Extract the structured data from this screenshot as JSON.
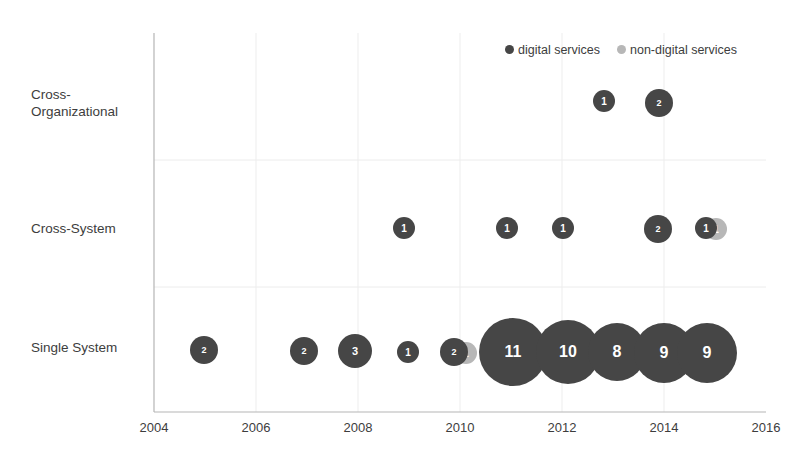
{
  "chart_data": {
    "type": "scatter",
    "title": "",
    "xlabel": "",
    "ylabel": "",
    "grid": true,
    "legend_position": "top-right",
    "xlim": [
      2004,
      2016
    ],
    "x_ticks": [
      "2004",
      "2006",
      "2008",
      "2010",
      "2012",
      "2014",
      "2016"
    ],
    "y_categories": [
      "Cross-\nOrganizational",
      "Cross-System",
      "Single System"
    ],
    "legend": [
      {
        "name": "digital services",
        "color": "#464646"
      },
      {
        "name": "non-digital services",
        "color": "#b7b7b7"
      }
    ],
    "series": [
      {
        "name": "digital services",
        "color": "#464646",
        "points": [
          {
            "x": 2013,
            "category": "Cross-Organizational",
            "value": 1
          },
          {
            "x": 2014,
            "category": "Cross-Organizational",
            "value": 2
          },
          {
            "x": 2009,
            "category": "Cross-System",
            "value": 1
          },
          {
            "x": 2011,
            "category": "Cross-System",
            "value": 1
          },
          {
            "x": 2012,
            "category": "Cross-System",
            "value": 1
          },
          {
            "x": 2014,
            "category": "Cross-System",
            "value": 2
          },
          {
            "x": 2015,
            "category": "Cross-System",
            "value": 1
          },
          {
            "x": 2005,
            "category": "Single System",
            "value": 2
          },
          {
            "x": 2007,
            "category": "Single System",
            "value": 2
          },
          {
            "x": 2008,
            "category": "Single System",
            "value": 3
          },
          {
            "x": 2009,
            "category": "Single System",
            "value": 1
          },
          {
            "x": 2010,
            "category": "Single System",
            "value": 2
          },
          {
            "x": 2011,
            "category": "Single System",
            "value": 11
          },
          {
            "x": 2012,
            "category": "Single System",
            "value": 10
          },
          {
            "x": 2013,
            "category": "Single System",
            "value": 8
          },
          {
            "x": 2014,
            "category": "Single System",
            "value": 9
          },
          {
            "x": 2015,
            "category": "Single System",
            "value": 9
          }
        ]
      },
      {
        "name": "non-digital services",
        "color": "#b7b7b7",
        "points": [
          {
            "x": 2015,
            "category": "Cross-System",
            "value": 1
          },
          {
            "x": 2010,
            "category": "Single System",
            "value": 1
          }
        ]
      }
    ],
    "bubbles": [
      {
        "label": "1",
        "series": "digital services",
        "cx": 604,
        "cy": 101,
        "r": 11
      },
      {
        "label": "2",
        "series": "digital services",
        "cx": 659,
        "cy": 103,
        "r": 14
      },
      {
        "label": "1",
        "series": "digital services",
        "cx": 404,
        "cy": 228,
        "r": 11
      },
      {
        "label": "1",
        "series": "digital services",
        "cx": 507,
        "cy": 228,
        "r": 11
      },
      {
        "label": "1",
        "series": "digital services",
        "cx": 563,
        "cy": 228,
        "r": 11
      },
      {
        "label": "2",
        "series": "digital services",
        "cx": 658,
        "cy": 229,
        "r": 14
      },
      {
        "label": "1",
        "series": "digital services",
        "cx": 706,
        "cy": 228,
        "r": 11
      },
      {
        "label": "1",
        "series": "non-digital services",
        "cx": 716,
        "cy": 229,
        "r": 11
      },
      {
        "label": "2",
        "series": "digital services",
        "cx": 204,
        "cy": 350,
        "r": 14
      },
      {
        "label": "2",
        "series": "digital services",
        "cx": 304,
        "cy": 351,
        "r": 14
      },
      {
        "label": "3",
        "series": "digital services",
        "cx": 355,
        "cy": 351,
        "r": 17
      },
      {
        "label": "1",
        "series": "digital services",
        "cx": 408,
        "cy": 352,
        "r": 11
      },
      {
        "label": "2",
        "series": "digital services",
        "cx": 454,
        "cy": 352,
        "r": 14
      },
      {
        "label": "1",
        "series": "non-digital services",
        "cx": 466,
        "cy": 353,
        "r": 11
      },
      {
        "label": "11",
        "series": "digital services",
        "cx": 513,
        "cy": 352,
        "r": 34
      },
      {
        "label": "10",
        "series": "digital services",
        "cx": 568,
        "cy": 352,
        "r": 32
      },
      {
        "label": "8",
        "series": "digital services",
        "cx": 617,
        "cy": 352,
        "r": 29
      },
      {
        "label": "9",
        "series": "digital services",
        "cx": 664,
        "cy": 353,
        "r": 30
      },
      {
        "label": "9",
        "series": "digital services",
        "cx": 707,
        "cy": 353,
        "r": 30
      }
    ]
  },
  "axes": {
    "x_ticks": [
      {
        "label": "2004",
        "x": 154
      },
      {
        "label": "2006",
        "x": 256
      },
      {
        "label": "2008",
        "x": 358
      },
      {
        "label": "2010",
        "x": 460
      },
      {
        "label": "2012",
        "x": 562
      },
      {
        "label": "2014",
        "x": 664
      },
      {
        "label": "2016",
        "x": 766
      }
    ],
    "y_labels": [
      {
        "label": "Cross-\nOrganizational"
      },
      {
        "label": "Cross-System"
      },
      {
        "label": "Single System"
      }
    ]
  },
  "legend": {
    "digital": "digital services",
    "nondigital": "non-digital services"
  },
  "colors": {
    "digital": "#464646",
    "nondigital": "#b7b7b7",
    "axis": "#a6a6a6",
    "grid": "#e8e8e8",
    "text": "#3d3d3d"
  }
}
